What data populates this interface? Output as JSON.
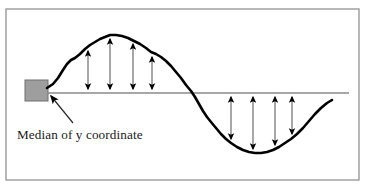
{
  "figure": {
    "type": "diagram",
    "background_color": "#ffffff",
    "frame": {
      "name": "figure-border",
      "x": 6,
      "y": 9,
      "width": 353,
      "height": 171,
      "stroke": "#9a9a9a",
      "stroke_width": 1.4
    },
    "median_line": {
      "label": "median-line",
      "x1": 47,
      "x2": 349,
      "y": 93,
      "color": "#8a8a8a",
      "stroke_width": 1.6
    },
    "start_marker": {
      "label": "start-block",
      "x": 25,
      "y": 80,
      "width": 23,
      "height": 21,
      "fill": "#9e9e9e",
      "stroke": "#6e6e6e"
    },
    "curve": {
      "label": "signal-curve",
      "color": "#000000",
      "stroke_width": 2.6,
      "points": [
        [
          47,
          88
        ],
        [
          53,
          84
        ],
        [
          58,
          78
        ],
        [
          63,
          70
        ],
        [
          67,
          64
        ],
        [
          71,
          60
        ],
        [
          75,
          58
        ],
        [
          80,
          54
        ],
        [
          85,
          49
        ],
        [
          90,
          45
        ],
        [
          95,
          42
        ],
        [
          100,
          39
        ],
        [
          105,
          37
        ],
        [
          110,
          35
        ],
        [
          116,
          35
        ],
        [
          122,
          36
        ],
        [
          128,
          38
        ],
        [
          134,
          41
        ],
        [
          140,
          44
        ],
        [
          146,
          48
        ],
        [
          151,
          52
        ],
        [
          156,
          54
        ],
        [
          161,
          57
        ],
        [
          166,
          61
        ],
        [
          171,
          66
        ],
        [
          176,
          72
        ],
        [
          181,
          78
        ],
        [
          186,
          85
        ],
        [
          191,
          91
        ],
        [
          195,
          97
        ],
        [
          199,
          104
        ],
        [
          203,
          111
        ],
        [
          207,
          117
        ],
        [
          211,
          122
        ],
        [
          216,
          128
        ],
        [
          221,
          134
        ],
        [
          226,
          139
        ],
        [
          231,
          143
        ],
        [
          237,
          147
        ],
        [
          243,
          150
        ],
        [
          249,
          152
        ],
        [
          255,
          153
        ],
        [
          261,
          153
        ],
        [
          267,
          152
        ],
        [
          273,
          150
        ],
        [
          279,
          147
        ],
        [
          285,
          143
        ],
        [
          291,
          139
        ],
        [
          297,
          134
        ],
        [
          303,
          128
        ],
        [
          309,
          121
        ],
        [
          315,
          114
        ],
        [
          321,
          108
        ],
        [
          327,
          103
        ],
        [
          332,
          100
        ]
      ]
    },
    "upper_arrows": {
      "label": "deviation-arrows-above-median",
      "color": "#8a8a8a",
      "head_color": "#000000",
      "stroke_width": 1.5,
      "items": [
        {
          "x": 88,
          "y_curve": 47,
          "y_median": 93
        },
        {
          "x": 110,
          "y_curve": 35,
          "y_median": 93
        },
        {
          "x": 133,
          "y_curve": 40,
          "y_median": 93
        },
        {
          "x": 152,
          "y_curve": 53,
          "y_median": 93
        }
      ]
    },
    "lower_arrows": {
      "label": "deviation-arrows-below-median",
      "color": "#8a8a8a",
      "head_color": "#000000",
      "stroke_width": 1.5,
      "items": [
        {
          "x": 231,
          "y_median": 93,
          "y_curve": 143
        },
        {
          "x": 253,
          "y_median": 93,
          "y_curve": 153
        },
        {
          "x": 275,
          "y_median": 93,
          "y_curve": 149
        },
        {
          "x": 292,
          "y_median": 93,
          "y_curve": 138
        }
      ]
    },
    "callout": {
      "label": "median-callout-arrow",
      "from_x": 73,
      "from_y": 123,
      "to_x": 51,
      "to_y": 96,
      "color": "#2a2a2a",
      "stroke_width": 1.2
    },
    "caption": {
      "label": "median-caption",
      "text": "Median of y coordinate",
      "x": 17,
      "y": 128,
      "color": "#1a1a1a",
      "font_size": 13.2
    }
  }
}
